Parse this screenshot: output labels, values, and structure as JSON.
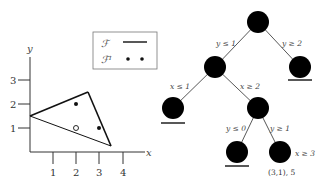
{
  "plot": {
    "x_label": "x",
    "y_label": "y",
    "x_ticks": [
      "1",
      "2",
      "3",
      "4"
    ],
    "y_ticks": [
      "1",
      "2",
      "3"
    ],
    "polygon_vertices": [
      [
        0,
        1.5
      ],
      [
        2.5,
        2.5
      ],
      [
        3.5,
        0.25
      ]
    ],
    "points_filled": [
      [
        2,
        2
      ],
      [
        3,
        1
      ]
    ],
    "points_hollow": [
      [
        2,
        1
      ]
    ]
  },
  "legend": {
    "items": [
      {
        "label": "ℱ",
        "symbol": "line"
      },
      {
        "label": "ℱᴵ",
        "symbol": "dots"
      }
    ]
  },
  "tree": {
    "nodes": [
      {
        "id": "root"
      },
      {
        "id": "n_y_le_1"
      },
      {
        "id": "n_y_ge_2",
        "pruned": true
      },
      {
        "id": "n_x_le_1",
        "pruned": true
      },
      {
        "id": "n_x_ge_2"
      },
      {
        "id": "n_y_le_0",
        "pruned": true
      },
      {
        "id": "n_y_ge_1",
        "annotation": "x ≥ 3",
        "solution": "(3,1), 5"
      }
    ],
    "edges": [
      {
        "from": "root",
        "to": "n_y_le_1",
        "label": "y ≤ 1"
      },
      {
        "from": "root",
        "to": "n_y_ge_2",
        "label": "y ≥ 2"
      },
      {
        "from": "n_y_le_1",
        "to": "n_x_le_1",
        "label": "x ≤ 1"
      },
      {
        "from": "n_y_le_1",
        "to": "n_x_ge_2",
        "label": "x ≥ 2"
      },
      {
        "from": "n_x_ge_2",
        "to": "n_y_le_0",
        "label": "y ≤ 0"
      },
      {
        "from": "n_x_ge_2",
        "to": "n_y_ge_1",
        "label": "y ≥ 1"
      }
    ],
    "leaf_annotation": "x ≥ 3",
    "solution_label": "(3,1), 5"
  }
}
